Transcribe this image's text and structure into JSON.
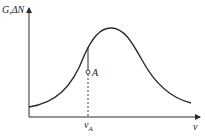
{
  "diagram": {
    "y_axis_label": "G,ΔN",
    "x_axis_label": "ν",
    "point_label": "A",
    "x_marker_label": "ν",
    "x_marker_subscript": "A",
    "curve": "bell-shaped gain curve with peak near center",
    "colors": {
      "line": "#2a2a2a",
      "background": "#ffffff"
    }
  }
}
